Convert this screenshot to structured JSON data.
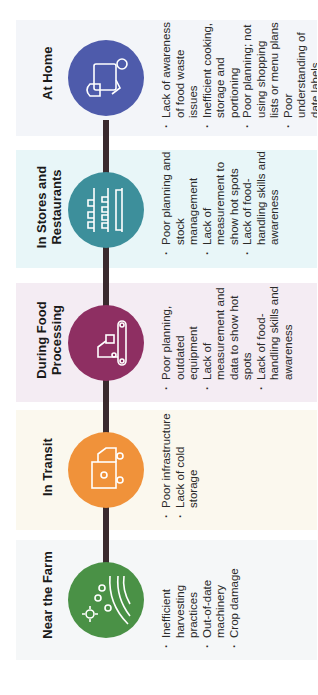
{
  "stages": [
    {
      "key": "home",
      "title": "At Home",
      "icon": "groceries-icon",
      "color": "#4e5bab",
      "bg": "#f3f5f9",
      "bullets": [
        "Lack of awareness of food waste issues",
        "Inefficient cooking, storage and portioning",
        "Poor planning; not using shopping lists or menu plans",
        "Poor understanding of date labels"
      ]
    },
    {
      "key": "stores",
      "title": "In Stores and Restaurants",
      "icon": "store-shelves-icon",
      "color": "#3d8f9b",
      "bg": "#e8f6f8",
      "bullets": [
        "Poor planning and stock management",
        "Lack of measurement to show hot spots",
        "Lack of food-handling skills and awareness"
      ]
    },
    {
      "key": "processing",
      "title": "During Food Processing",
      "icon": "conveyor-robot-icon",
      "color": "#8e2f62",
      "bg": "#f4ecf3",
      "bullets": [
        "Poor planning, outdated equipment",
        "Lack of measurement and data to show hot spots",
        "Lack of food-handling skills and awareness"
      ]
    },
    {
      "key": "transit",
      "title": "In Transit",
      "icon": "delivery-truck-icon",
      "color": "#f0923a",
      "bg": "#fbf8ee",
      "bullets": [
        "Poor infrastructure",
        "Lack of cold storage"
      ]
    },
    {
      "key": "farm",
      "title": "Near the Farm",
      "icon": "farm-field-icon",
      "color": "#4a9146",
      "bg": "#f5f7f8",
      "bullets": [
        "Inefficient harvesting practices",
        "Out-of-date machinery",
        "Crop damage"
      ]
    }
  ]
}
